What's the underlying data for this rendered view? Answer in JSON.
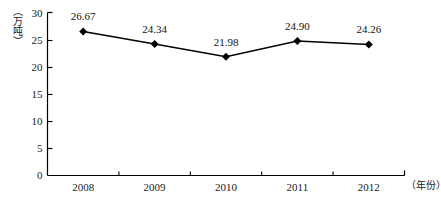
{
  "chart_data": {
    "type": "line",
    "title": "",
    "xlabel": "（年份）",
    "ylabel": "（万吨）",
    "categories": [
      "2008",
      "2009",
      "2010",
      "2011",
      "2012"
    ],
    "values": [
      26.67,
      24.34,
      21.98,
      24.9,
      24.26
    ],
    "point_labels": [
      "26.67",
      "24.34",
      "21.98",
      "24.90",
      "24.26"
    ],
    "ylim": [
      0,
      30
    ],
    "y_ticks": [
      "0",
      "5",
      "10",
      "15",
      "20",
      "25",
      "30"
    ],
    "y_tick_values": [
      0,
      5,
      10,
      15,
      20,
      25,
      30
    ],
    "grid": false,
    "legend": "none",
    "series_color": "#000000",
    "marker": "diamond",
    "axis_color": "#000000"
  },
  "axes": {
    "y_caption": "（万吨）",
    "x_caption": "（年份）"
  }
}
